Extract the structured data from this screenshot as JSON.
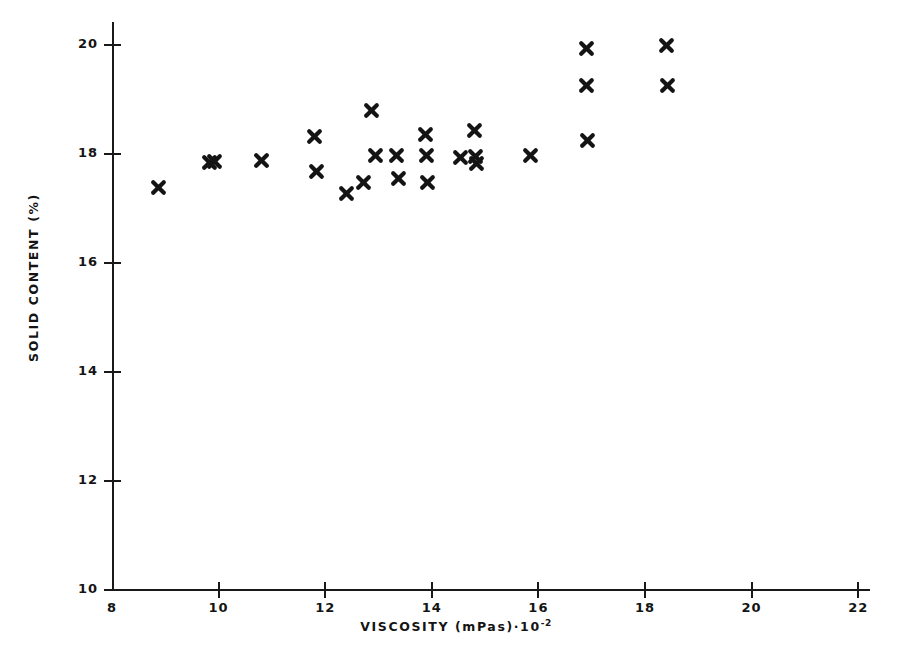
{
  "chart_data": {
    "type": "scatter",
    "title": "",
    "xlabel": "VISCOSITY (mPas)·10⁻²",
    "xlabel_main": "VISCOSITY  (mPas)·10",
    "xlabel_exponent": "-2",
    "ylabel": "SOLID CONTENT (%)",
    "xlim": [
      8,
      22
    ],
    "ylim": [
      10,
      20
    ],
    "xticks": [
      8,
      10,
      12,
      14,
      16,
      18,
      20,
      22
    ],
    "yticks": [
      10,
      12,
      14,
      16,
      18,
      20
    ],
    "xtick_labels": [
      "8",
      "10",
      "12",
      "14",
      "16",
      "18",
      "20",
      "22"
    ],
    "ytick_labels": [
      "10",
      "12",
      "14",
      "16",
      "18",
      "20"
    ],
    "grid": false,
    "legend": null,
    "marker": "x-thick-bold",
    "marker_color": "#141414",
    "points": [
      {
        "x": 8.88,
        "y": 17.38
      },
      {
        "x": 9.82,
        "y": 17.85
      },
      {
        "x": 9.92,
        "y": 17.87
      },
      {
        "x": 10.8,
        "y": 17.88
      },
      {
        "x": 11.8,
        "y": 18.33
      },
      {
        "x": 11.84,
        "y": 17.67
      },
      {
        "x": 12.4,
        "y": 17.27
      },
      {
        "x": 12.72,
        "y": 17.47
      },
      {
        "x": 12.86,
        "y": 18.8
      },
      {
        "x": 12.94,
        "y": 17.98
      },
      {
        "x": 13.34,
        "y": 17.98
      },
      {
        "x": 13.38,
        "y": 17.55
      },
      {
        "x": 13.88,
        "y": 18.36
      },
      {
        "x": 13.9,
        "y": 17.97
      },
      {
        "x": 13.92,
        "y": 17.47
      },
      {
        "x": 14.54,
        "y": 17.93
      },
      {
        "x": 14.8,
        "y": 18.43
      },
      {
        "x": 14.82,
        "y": 17.95
      },
      {
        "x": 14.84,
        "y": 17.82
      },
      {
        "x": 15.86,
        "y": 17.98
      },
      {
        "x": 16.9,
        "y": 19.93
      },
      {
        "x": 16.9,
        "y": 19.25
      },
      {
        "x": 16.92,
        "y": 18.25
      },
      {
        "x": 18.4,
        "y": 20.0
      },
      {
        "x": 18.42,
        "y": 19.25
      }
    ],
    "point_count": 25
  },
  "figure": {
    "background_color": "#ffffff",
    "axis_color": "#191919"
  }
}
